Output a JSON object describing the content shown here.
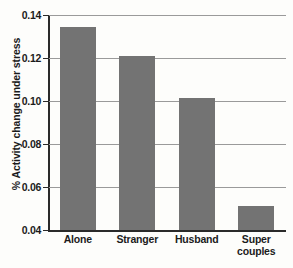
{
  "chart_data": {
    "type": "bar",
    "title": "",
    "xlabel": "",
    "ylabel": "% Activity change under stress",
    "categories": [
      "Alone",
      "Stranger",
      "Husband",
      "Super couples"
    ],
    "category_lines": [
      [
        "Alone"
      ],
      [
        "Stranger"
      ],
      [
        "Husband"
      ],
      [
        "Super",
        "couples"
      ]
    ],
    "values": [
      0.1345,
      0.121,
      0.1012,
      0.051
    ],
    "ylim": [
      0.04,
      0.14
    ],
    "ytick_labels": [
      "0.04",
      "0.06",
      "0.08",
      "0.10",
      "0.12",
      "0.14"
    ],
    "ytick_values": [
      0.04,
      0.06,
      0.08,
      0.1,
      0.12,
      0.14
    ],
    "grid": true,
    "legend": "none",
    "bar_color": "#737373",
    "axis_color": "#2a2a2a",
    "grid_color": "#9a9a9a",
    "background_color": "#fdfdfb"
  }
}
